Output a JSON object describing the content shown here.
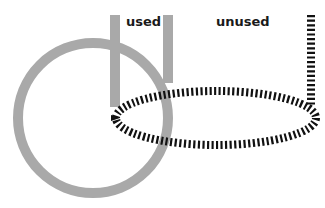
{
  "labels": {
    "used": "used",
    "unused": "unused"
  },
  "colors": {
    "used_stroke": "#a9a9a9",
    "unused_stroke": "#111111",
    "background": "#ffffff"
  },
  "shapes": {
    "used_loop": {
      "type": "circle",
      "style": "solid",
      "cx": 93,
      "cy": 118,
      "r": 75,
      "stroke_width": 10
    },
    "used_lead_1": {
      "type": "line",
      "style": "solid",
      "x": 115,
      "y1": 15,
      "y2": 106
    },
    "used_lead_2": {
      "type": "line",
      "style": "solid",
      "x": 168,
      "y1": 15,
      "y2": 82
    },
    "unused_loop": {
      "type": "ellipse",
      "style": "dashed",
      "cx": 216,
      "cy": 118,
      "rx": 100,
      "ry": 27
    },
    "unused_lead": {
      "type": "line",
      "style": "dashed",
      "x": 311,
      "y1": 15,
      "y2": 106
    }
  }
}
